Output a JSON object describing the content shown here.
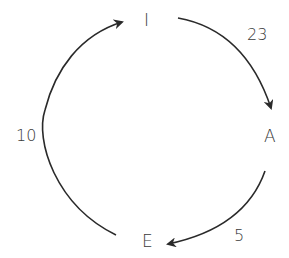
{
  "diagram": {
    "type": "cycle",
    "nodes": [
      {
        "id": "I",
        "label": "I"
      },
      {
        "id": "A",
        "label": "A"
      },
      {
        "id": "E",
        "label": "E"
      }
    ],
    "edges": [
      {
        "from": "I",
        "to": "A",
        "label": "23"
      },
      {
        "from": "A",
        "to": "E",
        "label": "5"
      },
      {
        "from": "E",
        "to": "I",
        "label": "10"
      }
    ],
    "colors": {
      "stroke": "#2a2a2a",
      "text": "#3a3a3a",
      "background": "#ffffff"
    }
  }
}
